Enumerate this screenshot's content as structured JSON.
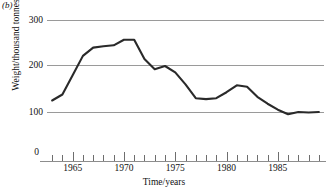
{
  "figure": {
    "panel_label": "(b)",
    "axis_color": "#9a9a9a",
    "line_color": "#2a2a2a",
    "background": "#ffffff"
  },
  "chart_data": {
    "type": "line",
    "title": "",
    "xlabel": "Time/years",
    "ylabel": "Weight/thousand tonnes",
    "xlim": [
      1962.5,
      1989.5
    ],
    "ylim": [
      0,
      300
    ],
    "xticks": [
      1963,
      1964,
      1965,
      1966,
      1967,
      1968,
      1969,
      1970,
      1971,
      1972,
      1973,
      1974,
      1975,
      1976,
      1977,
      1978,
      1979,
      1980,
      1981,
      1982,
      1983,
      1984,
      1985,
      1986,
      1987,
      1988,
      1989
    ],
    "xtick_labels": [
      "1965",
      "1970",
      "1975",
      "1980",
      "1985"
    ],
    "xtick_label_values": [
      1965,
      1970,
      1975,
      1980,
      1985
    ],
    "yticks": [
      0,
      100,
      200,
      300
    ],
    "ytick_labels": [
      "0",
      "100",
      "200",
      "300"
    ],
    "gridlines": [
      100,
      200,
      300
    ],
    "grid": true,
    "legend": "none",
    "x": [
      1963,
      1964,
      1965,
      1966,
      1967,
      1968,
      1969,
      1970,
      1971,
      1972,
      1973,
      1974,
      1975,
      1976,
      1977,
      1978,
      1979,
      1980,
      1981,
      1982,
      1983,
      1984,
      1985,
      1986,
      1987,
      1988,
      1989
    ],
    "values": [
      125,
      138,
      180,
      222,
      240,
      243,
      245,
      257,
      257,
      215,
      193,
      200,
      186,
      160,
      130,
      128,
      130,
      143,
      158,
      155,
      133,
      118,
      105,
      95,
      100,
      99,
      100
    ]
  }
}
